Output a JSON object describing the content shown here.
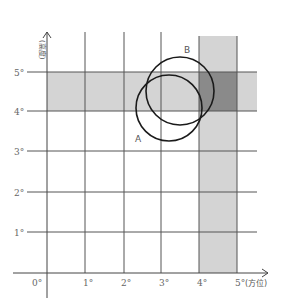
{
  "diagram": {
    "x_axis": {
      "label": "(方位)",
      "ticks": [
        "0°",
        "1°",
        "2°",
        "3°",
        "4°",
        "5°"
      ]
    },
    "y_axis": {
      "label": "(高度)",
      "ticks": [
        "1°",
        "2°",
        "3°",
        "4°",
        "5°"
      ]
    },
    "bands": [
      {
        "name": "horizontal-band",
        "range": "y 4°–5°",
        "color": "#d4d4d4"
      },
      {
        "name": "vertical-band",
        "range": "x 4°–5°",
        "color": "#d4d4d4"
      },
      {
        "name": "overlap-region",
        "color": "#8a8a8a"
      }
    ],
    "circles": [
      {
        "label": "A",
        "center": [
          3.2,
          4.1
        ],
        "radius_deg": 0.85
      },
      {
        "label": "B",
        "center": [
          3.5,
          4.5
        ],
        "radius_deg": 0.9
      }
    ],
    "colors": {
      "grid": "#555555",
      "band": "#d4d4d4",
      "overlap": "#8a8a8a",
      "circle": "#1a1a1a"
    }
  }
}
